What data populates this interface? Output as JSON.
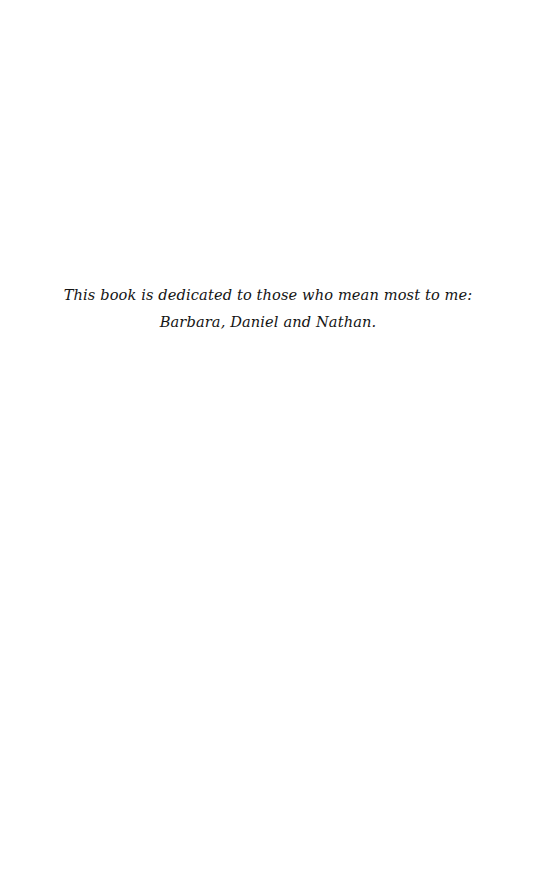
{
  "page": {
    "background_color": "#ffffff",
    "width": 536,
    "height": 878,
    "kind": "dedication-page"
  },
  "dedication": {
    "text_color": "#141414",
    "line_1": "This book is dedicated to those who mean most to me:",
    "line_2": "Barbara, Daniel and Nathan."
  }
}
